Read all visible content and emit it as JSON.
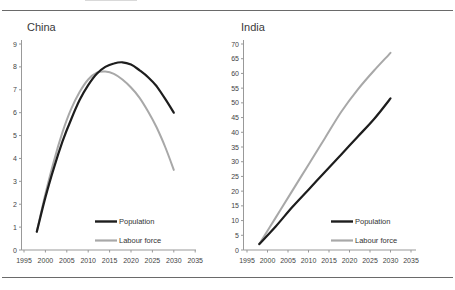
{
  "figure": {
    "background": "#ffffff",
    "rule_color": "#6a6a6a"
  },
  "chart_data": [
    {
      "type": "line",
      "title": "China",
      "xlabel": "",
      "ylabel": "",
      "xmin": 1995,
      "xmax": 2035,
      "xtick_interval": 5,
      "ymin": 0,
      "ymax": 9,
      "grid": false,
      "legend_position": "inside-lower-right",
      "xticks": [
        "1995",
        "2000",
        "2005",
        "2010",
        "2015",
        "2020",
        "2025",
        "2030",
        "2035"
      ],
      "yticks": [
        0,
        1,
        2,
        3,
        4,
        5,
        6,
        7,
        8,
        9
      ],
      "axis_color": "#999999",
      "tick_label_color": "#444444",
      "title_color": "#3a3a3a",
      "series": [
        {
          "name": "Population",
          "color": "#1d1d1d",
          "width": 2.2,
          "points": [
            [
              1998,
              0.8
            ],
            [
              2000,
              2.3
            ],
            [
              2002,
              3.6
            ],
            [
              2004,
              4.75
            ],
            [
              2006,
              5.7
            ],
            [
              2008,
              6.55
            ],
            [
              2010,
              7.2
            ],
            [
              2012,
              7.7
            ],
            [
              2014,
              8.0
            ],
            [
              2016,
              8.15
            ],
            [
              2018,
              8.2
            ],
            [
              2020,
              8.1
            ],
            [
              2022,
              7.85
            ],
            [
              2024,
              7.55
            ],
            [
              2026,
              7.15
            ],
            [
              2028,
              6.6
            ],
            [
              2030,
              6.0
            ]
          ]
        },
        {
          "name": "Labour force",
          "color": "#a8a8a8",
          "width": 2,
          "points": [
            [
              1998,
              0.8
            ],
            [
              2000,
              2.45
            ],
            [
              2002,
              3.9
            ],
            [
              2004,
              5.15
            ],
            [
              2006,
              6.15
            ],
            [
              2008,
              6.9
            ],
            [
              2010,
              7.45
            ],
            [
              2012,
              7.75
            ],
            [
              2014,
              7.8
            ],
            [
              2016,
              7.7
            ],
            [
              2018,
              7.45
            ],
            [
              2020,
              7.1
            ],
            [
              2022,
              6.65
            ],
            [
              2024,
              6.05
            ],
            [
              2026,
              5.35
            ],
            [
              2028,
              4.5
            ],
            [
              2030,
              3.5
            ]
          ]
        }
      ]
    },
    {
      "type": "line",
      "title": "India",
      "xlabel": "",
      "ylabel": "",
      "xmin": 1995,
      "xmax": 2035,
      "xtick_interval": 5,
      "ymin": 0,
      "ymax": 70,
      "grid": false,
      "legend_position": "inside-lower-right",
      "xticks": [
        "1995",
        "2000",
        "2005",
        "2010",
        "2015",
        "2020",
        "2025",
        "2030",
        "2035"
      ],
      "yticks": [
        0,
        5,
        10,
        15,
        20,
        25,
        30,
        35,
        40,
        45,
        50,
        55,
        60,
        65,
        70
      ],
      "axis_color": "#999999",
      "tick_label_color": "#444444",
      "title_color": "#3a3a3a",
      "series": [
        {
          "name": "Population",
          "color": "#1d1d1d",
          "width": 2.2,
          "points": [
            [
              1998,
              2
            ],
            [
              2002,
              8
            ],
            [
              2006,
              14.5
            ],
            [
              2010,
              20.5
            ],
            [
              2014,
              26.5
            ],
            [
              2018,
              32.5
            ],
            [
              2022,
              38.5
            ],
            [
              2026,
              44.5
            ],
            [
              2030,
              51.5
            ]
          ]
        },
        {
          "name": "Labour force",
          "color": "#a8a8a8",
          "width": 2,
          "points": [
            [
              1998,
              2
            ],
            [
              2002,
              11
            ],
            [
              2006,
              20
            ],
            [
              2010,
              29
            ],
            [
              2014,
              38
            ],
            [
              2018,
              47
            ],
            [
              2022,
              54.5
            ],
            [
              2026,
              61
            ],
            [
              2030,
              67
            ]
          ]
        }
      ]
    }
  ]
}
